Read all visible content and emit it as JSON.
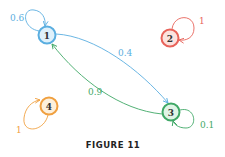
{
  "figure": {
    "caption": "FIGURE 11"
  },
  "nodes": [
    {
      "id": "1",
      "label": "1",
      "color": "#5aaee0",
      "fill": "#dff1fb",
      "cx": 47,
      "cy": 35
    },
    {
      "id": "2",
      "label": "2",
      "color": "#e8635a",
      "fill": "#fbe3df",
      "cx": 170,
      "cy": 38
    },
    {
      "id": "3",
      "label": "3",
      "color": "#3fa866",
      "fill": "#e0f4e6",
      "cx": 171,
      "cy": 112
    },
    {
      "id": "4",
      "label": "4",
      "color": "#f0a040",
      "fill": "#fdf0dc",
      "cx": 49,
      "cy": 106
    }
  ],
  "edges": [
    {
      "from": "1",
      "to": "1",
      "label": "0.6",
      "color": "#5aaee0"
    },
    {
      "from": "2",
      "to": "2",
      "label": "1",
      "color": "#e8635a"
    },
    {
      "from": "1",
      "to": "3",
      "label": "0.4",
      "color": "#5aaee0"
    },
    {
      "from": "3",
      "to": "1",
      "label": "0.9",
      "color": "#3fa866"
    },
    {
      "from": "3",
      "to": "3",
      "label": "0.1",
      "color": "#3fa866"
    },
    {
      "from": "4",
      "to": "4",
      "label": "1",
      "color": "#f0a040"
    }
  ]
}
